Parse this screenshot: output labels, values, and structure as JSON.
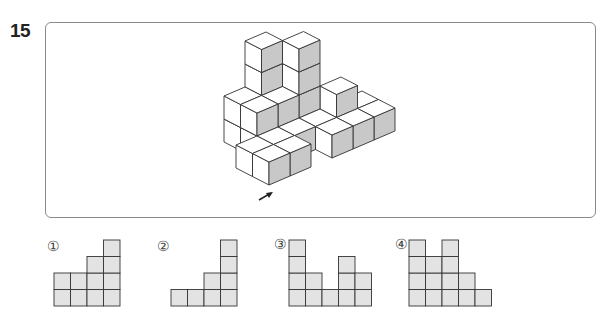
{
  "header": {
    "cutoff_text": "",
    "question_number": "15"
  },
  "figure": {
    "colors": {
      "face_light": "#ffffff",
      "face_shaded": "#c8c8c8",
      "edge": "#333333"
    },
    "origin": [
      269,
      185
    ],
    "axis_r": [
      21,
      -9
    ],
    "axis_l": [
      -16.5,
      -8.5
    ],
    "axis_u": [
      0,
      -23
    ],
    "cubes": [
      [
        0,
        1,
        0
      ],
      [
        0,
        0,
        0
      ],
      [
        1,
        1,
        0
      ],
      [
        1,
        0,
        0
      ],
      [
        2,
        2,
        0
      ],
      [
        2,
        1,
        0
      ],
      [
        2,
        2,
        1
      ],
      [
        1,
        2,
        0
      ],
      [
        1,
        2,
        1
      ],
      [
        1,
        3,
        0
      ],
      [
        1,
        3,
        1
      ],
      [
        3,
        2,
        0
      ],
      [
        3,
        2,
        1
      ],
      [
        3,
        2,
        2
      ],
      [
        3,
        2,
        3
      ],
      [
        2,
        3,
        0
      ],
      [
        2,
        3,
        1
      ],
      [
        2,
        3,
        2
      ],
      [
        2,
        3,
        3
      ],
      [
        3,
        1,
        0
      ],
      [
        3,
        0,
        0
      ],
      [
        4,
        0,
        0
      ],
      [
        4,
        1,
        0
      ],
      [
        4,
        1,
        1
      ],
      [
        5,
        0,
        0
      ],
      [
        5,
        1,
        0
      ]
    ],
    "arrow": {
      "from": [
        259,
        200
      ],
      "to": [
        273,
        192
      ]
    }
  },
  "options": [
    {
      "label": "①",
      "columns": [
        2,
        2,
        3,
        4
      ],
      "label_pos": [
        47,
        238
      ],
      "grid_pos": [
        53,
        238
      ]
    },
    {
      "label": "②",
      "columns": [
        1,
        1,
        2,
        4
      ],
      "label_pos": [
        157,
        238
      ],
      "grid_pos": [
        170,
        238
      ]
    },
    {
      "label": "③",
      "columns": [
        4,
        2,
        1,
        3,
        2
      ],
      "label_pos": [
        274,
        236
      ],
      "grid_pos": [
        288,
        237
      ]
    },
    {
      "label": "④",
      "columns": [
        4,
        3,
        4,
        2,
        1
      ],
      "label_pos": [
        395,
        236
      ],
      "grid_pos": [
        408,
        236
      ]
    }
  ],
  "option_style": {
    "cell_size": 16.5,
    "fill": "#e3e3e3",
    "stroke": "#333333"
  }
}
